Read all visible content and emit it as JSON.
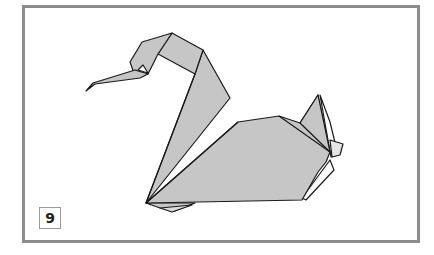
{
  "diagram": {
    "step_number": "9",
    "colors": {
      "paper_fill": "#c6c6c6",
      "paper_light": "#ffffff",
      "outline": "#1a1a1a",
      "frame": "#8c8c8c"
    }
  }
}
